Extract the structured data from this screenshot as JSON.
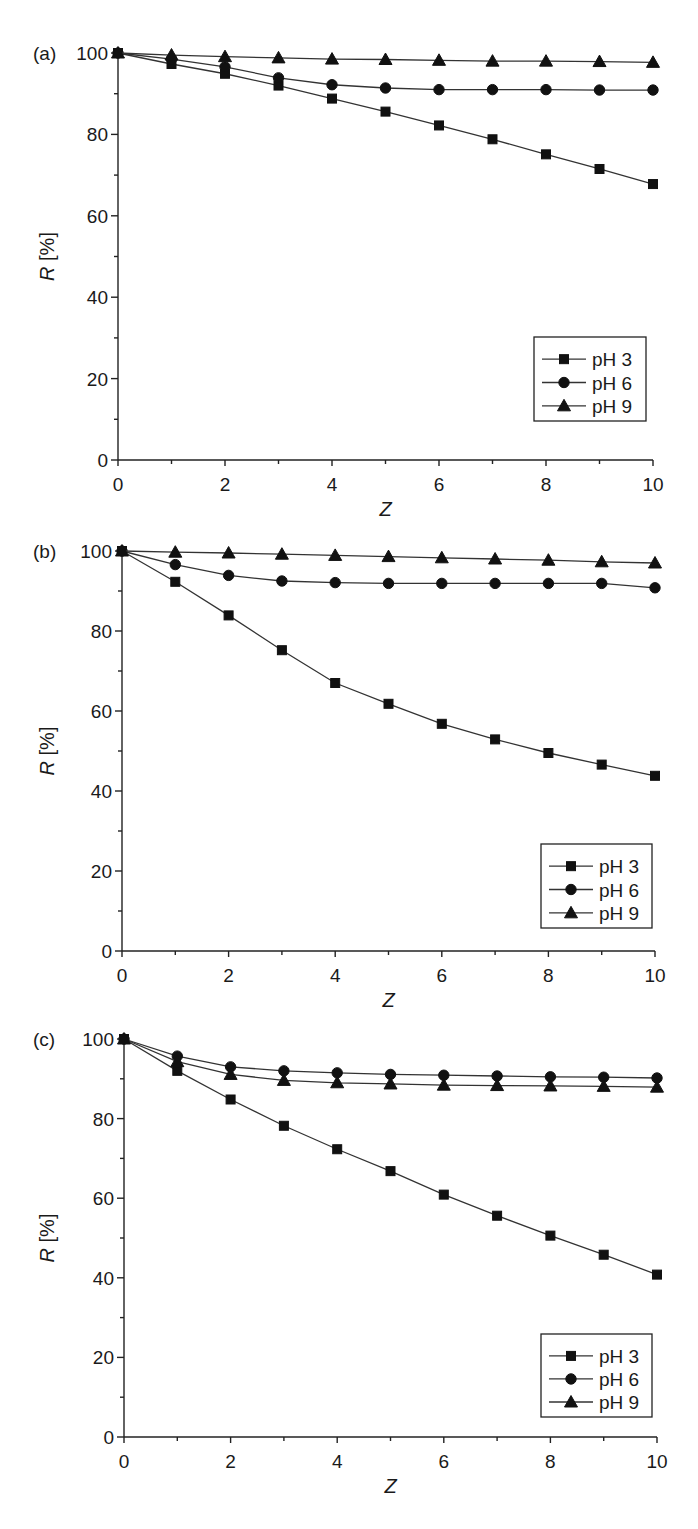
{
  "figure": {
    "panels": [
      "(a)",
      "(b)",
      "(c)"
    ]
  },
  "chart_data": [
    {
      "type": "line",
      "panel_label": "(a)",
      "title": "",
      "xlabel": "Z",
      "ylabel": "R [%]",
      "xlim": [
        0,
        10
      ],
      "ylim": [
        0,
        100
      ],
      "x_ticks": [
        0,
        2,
        4,
        6,
        8,
        10
      ],
      "y_ticks": [
        0,
        20,
        40,
        60,
        80,
        100
      ],
      "grid": false,
      "legend_position": "lower right",
      "x": [
        0,
        1,
        2,
        3,
        4,
        5,
        6,
        7,
        8,
        9,
        10
      ],
      "series": [
        {
          "name": "pH 3",
          "marker": "square",
          "values": [
            100,
            97.3,
            94.9,
            92.0,
            88.8,
            85.6,
            82.2,
            78.8,
            75.1,
            71.5,
            67.8
          ]
        },
        {
          "name": "pH 6",
          "marker": "circle",
          "values": [
            100,
            98.5,
            96.6,
            93.9,
            92.2,
            91.4,
            91.0,
            91.0,
            91.0,
            90.9,
            90.9
          ]
        },
        {
          "name": "pH 9",
          "marker": "triangle",
          "values": [
            100,
            99.5,
            99.1,
            98.8,
            98.5,
            98.4,
            98.2,
            98.0,
            98.0,
            97.9,
            97.7
          ]
        }
      ],
      "layout": {
        "x0": 118,
        "x1": 653,
        "yTop": 53,
        "yBottom": 460,
        "legend": {
          "x": 534,
          "y": 337,
          "w": 112,
          "h": 84
        }
      }
    },
    {
      "type": "line",
      "panel_label": "(b)",
      "title": "",
      "xlabel": "Z",
      "ylabel": "R [%]",
      "xlim": [
        0,
        10
      ],
      "ylim": [
        0,
        100
      ],
      "x_ticks": [
        0,
        2,
        4,
        6,
        8,
        10
      ],
      "y_ticks": [
        0,
        20,
        40,
        60,
        80,
        100
      ],
      "grid": false,
      "legend_position": "lower right",
      "x": [
        0,
        1,
        2,
        3,
        4,
        5,
        6,
        7,
        8,
        9,
        10
      ],
      "series": [
        {
          "name": "pH 3",
          "marker": "square",
          "values": [
            100,
            92.3,
            83.9,
            75.2,
            67.0,
            61.8,
            56.8,
            52.9,
            49.5,
            46.6,
            43.8
          ]
        },
        {
          "name": "pH 6",
          "marker": "circle",
          "values": [
            100,
            96.6,
            93.9,
            92.5,
            92.1,
            91.9,
            91.9,
            91.9,
            91.9,
            91.9,
            90.8
          ]
        },
        {
          "name": "pH 9",
          "marker": "triangle",
          "values": [
            100,
            99.7,
            99.5,
            99.2,
            98.9,
            98.6,
            98.3,
            98.0,
            97.7,
            97.3,
            97.0
          ]
        }
      ],
      "layout": {
        "x0": 122,
        "x1": 655,
        "yTop": 551,
        "yBottom": 951,
        "legend": {
          "x": 541,
          "y": 844,
          "w": 111,
          "h": 84
        }
      }
    },
    {
      "type": "line",
      "panel_label": "(c)",
      "title": "",
      "xlabel": "Z",
      "ylabel": "R [%]",
      "xlim": [
        0,
        10
      ],
      "ylim": [
        0,
        100
      ],
      "x_ticks": [
        0,
        2,
        4,
        6,
        8,
        10
      ],
      "y_ticks": [
        0,
        20,
        40,
        60,
        80,
        100
      ],
      "grid": false,
      "legend_position": "lower right",
      "x": [
        0,
        1,
        2,
        3,
        4,
        5,
        6,
        7,
        8,
        9,
        10
      ],
      "series": [
        {
          "name": "pH 3",
          "marker": "square",
          "values": [
            100,
            92.0,
            84.8,
            78.2,
            72.3,
            66.8,
            60.9,
            55.6,
            50.6,
            45.8,
            40.8
          ]
        },
        {
          "name": "pH 6",
          "marker": "circle",
          "values": [
            100,
            95.7,
            93.0,
            92.0,
            91.5,
            91.1,
            90.9,
            90.7,
            90.5,
            90.4,
            90.2
          ]
        },
        {
          "name": "pH 9",
          "marker": "triangle",
          "values": [
            100,
            94.3,
            91.1,
            89.6,
            89.0,
            88.7,
            88.4,
            88.3,
            88.2,
            88.1,
            87.9
          ]
        }
      ],
      "layout": {
        "x0": 124,
        "x1": 657,
        "yTop": 1039,
        "yBottom": 1437,
        "legend": {
          "x": 541,
          "y": 1334,
          "w": 111,
          "h": 83
        }
      }
    }
  ]
}
